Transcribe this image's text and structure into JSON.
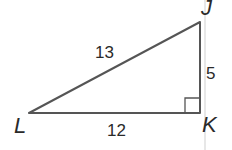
{
  "diagram": {
    "type": "right-triangle",
    "vertices": {
      "L": {
        "label": "L",
        "x": 29,
        "y": 113
      },
      "K": {
        "label": "K",
        "x": 200,
        "y": 113
      },
      "J": {
        "label": "J",
        "x": 200,
        "y": 22
      }
    },
    "sides": {
      "LJ": {
        "label": "13"
      },
      "LK": {
        "label": "12"
      },
      "JK": {
        "label": "5"
      }
    },
    "right_angle_at": "K",
    "colors": {
      "line": "#555555",
      "text": "#2a2a2a",
      "guide": "#c8c8c8"
    }
  }
}
